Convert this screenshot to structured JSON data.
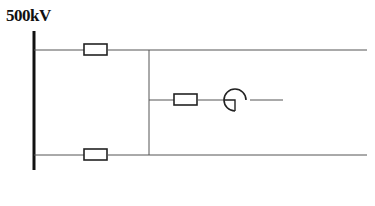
{
  "diagram": {
    "bus_label": "500kV",
    "colors": {
      "line": "#555555",
      "bus": "#111111",
      "element": "#222222",
      "background": "#ffffff"
    },
    "bus": {
      "x": 34,
      "y1": 31,
      "y2": 170
    },
    "lines": [
      {
        "id": "top-line",
        "y": 50,
        "x1": 34,
        "x2": 367
      },
      {
        "id": "bottom-line",
        "y": 155,
        "x1": 34,
        "x2": 367
      },
      {
        "id": "vertical-tie",
        "x": 149,
        "y1": 50,
        "y2": 155
      },
      {
        "id": "middle-branch",
        "y": 100,
        "x1": 149,
        "x2": 283
      }
    ],
    "resistors": [
      {
        "id": "top-resistor",
        "x": 84,
        "y": 44,
        "w": 23,
        "h": 11
      },
      {
        "id": "middle-resistor",
        "x": 174,
        "y": 94,
        "w": 23,
        "h": 11
      },
      {
        "id": "bottom-resistor",
        "x": 84,
        "y": 149,
        "w": 23,
        "h": 11
      }
    ],
    "generator": {
      "cx": 235,
      "cy": 100,
      "r": 11
    }
  }
}
